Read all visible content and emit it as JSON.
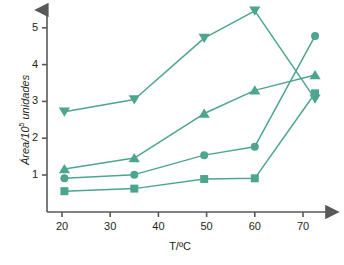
{
  "chart_data": {
    "type": "line",
    "title": "",
    "xlabel": "T/ºC",
    "ylabel_main": "Área/10",
    "ylabel_sup": "5",
    "ylabel_tail": " unidades",
    "xlim": [
      15,
      76
    ],
    "ylim": [
      0.25,
      5.7
    ],
    "xticks": [
      20,
      30,
      40,
      50,
      60,
      70
    ],
    "xtick_labels": [
      "20",
      "30",
      "40",
      "50",
      "60",
      "70"
    ],
    "yticks": [
      1,
      2,
      3,
      4,
      5
    ],
    "ytick_labels": [
      "1",
      "2",
      "3",
      "4",
      "5"
    ],
    "grid": false,
    "legend": "none",
    "accent_color": "#4da58f",
    "axis_color": "#58595b",
    "text_color": "#231f20",
    "x": [
      20.5,
      35,
      49.5,
      60,
      72.5
    ],
    "series": [
      {
        "name": "serie-triangulo-abajo",
        "marker": "triangle-down",
        "values": [
          2.72,
          3.05,
          4.72,
          5.46,
          3.07
        ]
      },
      {
        "name": "serie-triangulo-arriba",
        "marker": "triangle-up",
        "values": [
          1.16,
          1.46,
          2.67,
          3.3,
          3.72
        ]
      },
      {
        "name": "serie-circulo",
        "marker": "circle",
        "values": [
          0.91,
          1.01,
          1.54,
          1.77,
          4.78
        ]
      },
      {
        "name": "serie-cuadrado",
        "marker": "square",
        "values": [
          0.56,
          0.63,
          0.89,
          0.91,
          3.22
        ]
      }
    ]
  }
}
